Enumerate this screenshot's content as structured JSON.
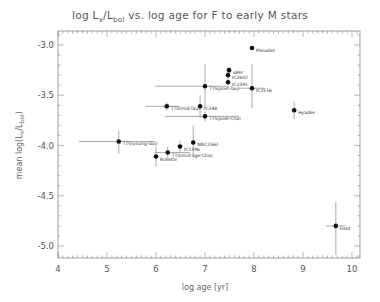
{
  "chart_data": {
    "type": "scatter",
    "title": "log Lx/Lbol vs. log age for F to early M stars",
    "title_parts": {
      "pre": "log L",
      "sub1": "x",
      "mid": "/L",
      "sub2": "bol",
      "post": " vs. log age for F to early M stars"
    },
    "xlabel": "log age [yr]",
    "ylabel": "mean log(Lx/Lbol)",
    "ylabel_parts": {
      "pre": "mean log(L",
      "sub1": "x",
      "mid": "/L",
      "sub2": "bol",
      "post": ")"
    },
    "xlim": [
      4,
      10.2
    ],
    "ylim": [
      -5.2,
      -2.8
    ],
    "x_ticks": [
      4,
      5,
      6,
      7,
      8,
      9,
      10
    ],
    "x_tick_labels": [
      "4",
      "5",
      "6",
      "7",
      "8",
      "9",
      "10"
    ],
    "y_ticks": [
      -3.0,
      -3.5,
      -4.0,
      -4.5,
      -5.0
    ],
    "y_tick_labels": [
      "-3.0",
      "-3.5",
      "-4.0",
      "-4.5",
      "-5.0"
    ],
    "grid": false,
    "points": [
      {
        "label": "Pleiades",
        "x": 7.96,
        "y": -3.03,
        "xerr": [
          7.96,
          7.96
        ],
        "yerr": [
          -3.01,
          -3.05
        ]
      },
      {
        "label": "αPer",
        "x": 7.49,
        "y": -3.25,
        "xerr": [
          7.49,
          7.49
        ],
        "yerr": [
          -3.22,
          -3.28
        ]
      },
      {
        "label": "IC2602",
        "x": 7.47,
        "y": -3.3,
        "xerr": [
          7.47,
          7.47
        ],
        "yerr": [
          -3.26,
          -3.33
        ]
      },
      {
        "label": "IC2391",
        "x": 7.47,
        "y": -3.37,
        "xerr": [
          7.47,
          7.47
        ],
        "yerr": [
          -3.33,
          -3.4
        ]
      },
      {
        "label": "IC2516",
        "x": 7.96,
        "y": -3.43,
        "xerr": [
          7.69,
          8.22
        ],
        "yerr": [
          -3.19,
          -3.63
        ]
      },
      {
        "label": "TTS(post-Tau)",
        "x": 7.0,
        "y": -3.41,
        "xerr": [
          5.98,
          7.49
        ],
        "yerr": [
          -3.19,
          -3.63
        ]
      },
      {
        "label": "TTS(mid-Tau)",
        "x": 6.22,
        "y": -3.61,
        "xerr": [
          5.78,
          6.49
        ],
        "yerr": [
          -3.57,
          -3.65
        ]
      },
      {
        "label": "IC348",
        "x": 6.9,
        "y": -3.61,
        "xerr": [
          6.9,
          6.9
        ],
        "yerr": [
          -3.5,
          -3.73
        ]
      },
      {
        "label": "TTS(post-Cha)",
        "x": 7.0,
        "y": -3.71,
        "xerr": [
          6.18,
          7.69
        ],
        "yerr": [
          -3.66,
          -3.76
        ]
      },
      {
        "label": "NGC2362",
        "x": 6.76,
        "y": -3.97,
        "xerr": [
          6.76,
          6.76
        ],
        "yerr": [
          -3.8,
          -4.1
        ]
      },
      {
        "label": "IC1396",
        "x": 6.49,
        "y": -4.01,
        "xerr": [
          6.49,
          6.49
        ],
        "yerr": [
          -3.95,
          -4.07
        ]
      },
      {
        "label": "TTS(young-Tau)",
        "x": 5.24,
        "y": -3.96,
        "xerr": [
          4.43,
          5.98
        ],
        "yerr": [
          -3.85,
          -4.08
        ]
      },
      {
        "label": "TTS(mid-age-Cha)",
        "x": 6.24,
        "y": -4.07,
        "xerr": [
          5.98,
          6.69
        ],
        "yerr": [
          -4.01,
          -4.13
        ]
      },
      {
        "label": "Rosette",
        "x": 6.0,
        "y": -4.11,
        "xerr": [
          5.95,
          6.05
        ],
        "yerr": [
          -4.01,
          -4.21
        ]
      },
      {
        "label": "Hyades",
        "x": 8.82,
        "y": -3.65,
        "xerr": [
          8.82,
          8.82
        ],
        "yerr": [
          -3.57,
          -3.74
        ]
      },
      {
        "label": "Field",
        "x": 9.67,
        "y": -4.8,
        "xerr": [
          9.47,
          9.87
        ],
        "yerr": [
          -4.56,
          -5.09
        ]
      }
    ]
  },
  "colors": {
    "axis": "#888888",
    "point": "#111111",
    "errorbar": "#888888",
    "text": "#555555"
  }
}
